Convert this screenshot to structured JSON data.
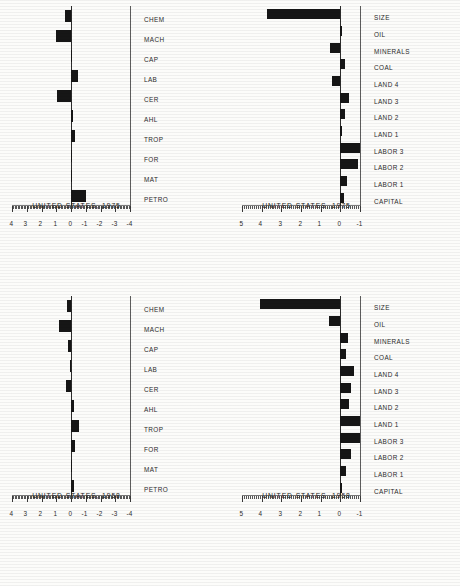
{
  "page": {
    "orientation": "landscape-page-rotated-90",
    "background_color": "#fcfcfa",
    "bar_color": "#161616",
    "axis_color": "#3a3a3a"
  },
  "charts": [
    {
      "id": "commodity-1958",
      "position": "lower-left",
      "type": "bar",
      "title": "",
      "xlabel": "UNITED STATES, 1958",
      "ylabel": "",
      "orientation": "vertical",
      "categories": [
        "PETRO",
        "MAT",
        "FOR",
        "TROP",
        "AHL",
        "CER",
        "LAB",
        "CAP",
        "MACH",
        "CHEM"
      ],
      "values": [
        -0.22,
        -0.1,
        -0.24,
        -0.52,
        -0.2,
        0.36,
        0.1,
        0.2,
        0.82,
        0.28
      ],
      "ylim": [
        -4,
        4
      ],
      "ticks": [
        -4,
        -3,
        -2,
        -1,
        0,
        1,
        2,
        3,
        4
      ],
      "grid": false,
      "legend": "none"
    },
    {
      "id": "commodity-1975",
      "position": "upper-left",
      "type": "bar",
      "title": "",
      "xlabel": "UNITED STATES, 1975",
      "ylabel": "",
      "orientation": "vertical",
      "categories": [
        "PETRO",
        "MAT",
        "FOR",
        "TROP",
        "AHL",
        "CER",
        "LAB",
        "CAP",
        "MACH",
        "CHEM"
      ],
      "values": [
        -1.05,
        0.03,
        -0.02,
        -0.3,
        -0.12,
        0.95,
        -0.46,
        -0.08,
        1.05,
        0.38
      ],
      "ylim": [
        -4,
        4
      ],
      "ticks": [
        -4,
        -3,
        -2,
        -1,
        0,
        1,
        2,
        3,
        4
      ],
      "grid": false,
      "legend": "none"
    },
    {
      "id": "endowment-1958",
      "position": "lower-right",
      "type": "bar",
      "title": "",
      "xlabel": "UNITED STATES, 1958",
      "ylabel": "",
      "orientation": "vertical",
      "categories": [
        "CAPITAL",
        "LABOR 1",
        "LABOR 2",
        "LABOR 3",
        "LAND 1",
        "LAND 2",
        "LAND 3",
        "LAND 4",
        "COAL",
        "MINERALS",
        "OIL",
        "SIZE"
      ],
      "values": [
        -0.05,
        -0.3,
        -0.55,
        -1.0,
        -1.0,
        -0.42,
        -0.52,
        -0.7,
        -0.28,
        -0.38,
        0.58,
        4.1
      ],
      "ylim": [
        -1,
        5
      ],
      "ticks": [
        -1,
        0,
        1,
        2,
        3,
        4,
        5
      ],
      "grid": false,
      "legend": "none"
    },
    {
      "id": "endowment-1975",
      "position": "upper-right",
      "type": "bar",
      "title": "",
      "xlabel": "UNITED STATES, 1975",
      "ylabel": "",
      "orientation": "vertical",
      "categories": [
        "CAPITAL",
        "LABOR 1",
        "LABOR 2",
        "LABOR 3",
        "LAND 1",
        "LAND 2",
        "LAND 3",
        "LAND 4",
        "COAL",
        "MINERALS",
        "OIL",
        "SIZE"
      ],
      "values": [
        -0.18,
        -0.32,
        -0.9,
        -1.0,
        -0.1,
        -0.25,
        -0.42,
        0.4,
        -0.22,
        0.52,
        0.0,
        3.75
      ],
      "ylim": [
        -1,
        5
      ],
      "ticks": [
        -1,
        0,
        1,
        2,
        3,
        4,
        5
      ],
      "grid": false,
      "legend": "none"
    }
  ],
  "chart_data": {
    "type": "bar",
    "panels": 4,
    "shared_note": "Four vertical bar charts arranged 2x2 on a page rotated 90 degrees; left column uses commodity-group categories with axis -4..4, right column uses factor-endowment categories with axis -1..5.",
    "series": [
      {
        "name": "UNITED STATES, 1958 (commodity groups)",
        "categories": [
          "PETRO",
          "MAT",
          "FOR",
          "TROP",
          "AHL",
          "CER",
          "LAB",
          "CAP",
          "MACH",
          "CHEM"
        ],
        "values": [
          -0.22,
          -0.1,
          -0.24,
          -0.52,
          -0.2,
          0.36,
          0.1,
          0.2,
          0.82,
          0.28
        ],
        "ylim": [
          -4,
          4
        ]
      },
      {
        "name": "UNITED STATES, 1975 (commodity groups)",
        "categories": [
          "PETRO",
          "MAT",
          "FOR",
          "TROP",
          "AHL",
          "CER",
          "LAB",
          "CAP",
          "MACH",
          "CHEM"
        ],
        "values": [
          -1.05,
          0.03,
          -0.02,
          -0.3,
          -0.12,
          0.95,
          -0.46,
          -0.08,
          1.05,
          0.38
        ],
        "ylim": [
          -4,
          4
        ]
      },
      {
        "name": "UNITED STATES, 1958 (factor endowments)",
        "categories": [
          "CAPITAL",
          "LABOR 1",
          "LABOR 2",
          "LABOR 3",
          "LAND 1",
          "LAND 2",
          "LAND 3",
          "LAND 4",
          "COAL",
          "MINERALS",
          "OIL",
          "SIZE"
        ],
        "values": [
          -0.05,
          -0.3,
          -0.55,
          -1.0,
          -1.0,
          -0.42,
          -0.52,
          -0.7,
          -0.28,
          -0.38,
          0.58,
          4.1
        ],
        "ylim": [
          -1,
          5
        ]
      },
      {
        "name": "UNITED STATES, 1975 (factor endowments)",
        "categories": [
          "CAPITAL",
          "LABOR 1",
          "LABOR 2",
          "LABOR 3",
          "LAND 1",
          "LAND 2",
          "LAND 3",
          "LAND 4",
          "COAL",
          "MINERALS",
          "OIL",
          "SIZE"
        ],
        "values": [
          -0.18,
          -0.32,
          -0.9,
          -1.0,
          -0.1,
          -0.25,
          -0.42,
          0.4,
          -0.22,
          0.52,
          0.0,
          3.75
        ],
        "ylim": [
          -1,
          5
        ]
      }
    ],
    "title": "",
    "xlabel": "",
    "ylabel": "",
    "grid": false,
    "legend": "none"
  }
}
